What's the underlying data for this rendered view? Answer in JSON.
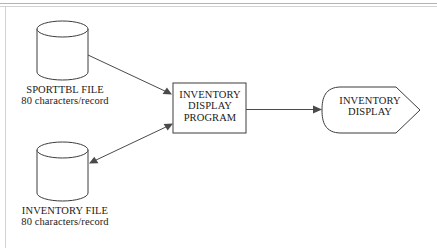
{
  "diagram": {
    "colors": {
      "shape_stroke": "#3c3c3c",
      "connector": "#4a4a4a",
      "frame": "#b4b4b4",
      "background": "#ffffff",
      "text": "#1a1a1a"
    },
    "nodes": {
      "sporttbl_file": {
        "shape": "cylinder",
        "label_line1": "SPORTTBL FILE",
        "label_line2": "80 characters/record"
      },
      "inventory_file": {
        "shape": "cylinder",
        "label_line1": "INVENTORY FILE",
        "label_line2": "80 characters/record"
      },
      "program": {
        "shape": "process-rectangle",
        "label_line1": "INVENTORY",
        "label_line2": "DISPLAY",
        "label_line3": "PROGRAM"
      },
      "display": {
        "shape": "display-symbol",
        "label_line1": "INVENTORY",
        "label_line2": "DISPLAY"
      }
    },
    "connectors": [
      {
        "name": "sporttbl-to-program",
        "from": "sporttbl_file",
        "to": "program",
        "direction": "one-way"
      },
      {
        "name": "program-to-inventory-file",
        "from": "program",
        "to": "inventory_file",
        "direction": "two-way"
      },
      {
        "name": "program-to-display",
        "from": "program",
        "to": "display",
        "direction": "one-way"
      }
    ]
  }
}
